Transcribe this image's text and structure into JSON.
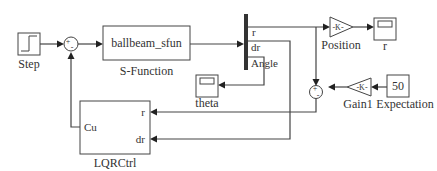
{
  "blocks": {
    "step": {
      "label": "Step"
    },
    "sum1": {
      "signs": "+-"
    },
    "sfun": {
      "name": "ballbeam_sfun",
      "label": "S-Function"
    },
    "bus": {
      "ports": [
        "r",
        "dr",
        "Angle"
      ]
    },
    "position_gain": {
      "glyph": "-K-",
      "label": "Position"
    },
    "scope_r": {
      "label": "r"
    },
    "scope_theta": {
      "label": "theta"
    },
    "sum2": {
      "signs": "+-"
    },
    "gain1": {
      "glyph": "-K-",
      "label": "Gain1"
    },
    "expectation": {
      "value": "50",
      "label": "Expectation"
    },
    "lqr": {
      "label": "LQRCtrl",
      "in_ports": [
        "r",
        "dr"
      ],
      "out_port": "Cu"
    }
  }
}
